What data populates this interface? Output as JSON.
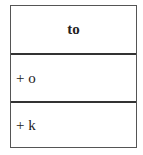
{
  "uml_class": {
    "name": "to",
    "attributes": [
      {
        "label": "+ o"
      },
      {
        "label": "+ k"
      }
    ]
  },
  "colors": {
    "border": "#555555",
    "divider": "#333333",
    "background": "#ffffff"
  }
}
